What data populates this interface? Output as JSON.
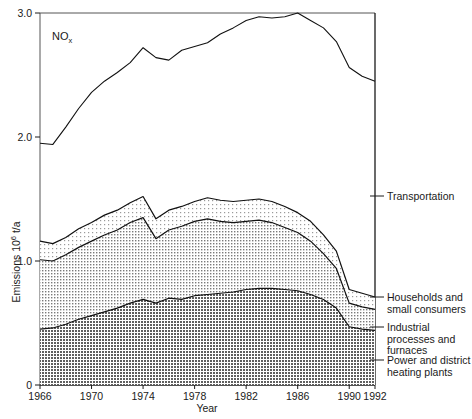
{
  "chart_data": {
    "type": "area",
    "title": "",
    "annotation": "NOx",
    "annotation_base": "NO",
    "annotation_sub": "x",
    "xlabel": "Year",
    "ylabel": "Emissions 10",
    "ylabel_sup": "6",
    "ylabel_tail": " t/a",
    "xlim": [
      1966,
      1992
    ],
    "ylim": [
      0,
      3.0
    ],
    "grid": false,
    "legend_position": "right-outside",
    "xticks": [
      1966,
      1970,
      1974,
      1978,
      1982,
      1986,
      1990,
      1992
    ],
    "xtick_labels": [
      "1966",
      "1970",
      "1974",
      "1978",
      "1982",
      "1986",
      "1990",
      "1992"
    ],
    "yticks": [
      0,
      1.0,
      2.0,
      3.0
    ],
    "ytick_labels": [
      "0",
      "1.0",
      "2.0",
      "3.0"
    ],
    "x": [
      1966,
      1967,
      1968,
      1969,
      1970,
      1971,
      1972,
      1973,
      1974,
      1975,
      1976,
      1977,
      1978,
      1979,
      1980,
      1981,
      1982,
      1983,
      1984,
      1985,
      1986,
      1987,
      1988,
      1989,
      1990,
      1991,
      1992
    ],
    "series": [
      {
        "name": "Power and district heating plants",
        "label": "Power and district\nheating plants",
        "label_lines": [
          "Power and district",
          "heating plants"
        ],
        "fill": "#8c8c8c",
        "values": [
          0.45,
          0.46,
          0.49,
          0.53,
          0.56,
          0.59,
          0.62,
          0.66,
          0.69,
          0.66,
          0.7,
          0.69,
          0.72,
          0.73,
          0.74,
          0.75,
          0.77,
          0.78,
          0.78,
          0.77,
          0.76,
          0.73,
          0.69,
          0.62,
          0.47,
          0.45,
          0.44
        ]
      },
      {
        "name": "Industrial processes and furnaces",
        "label": "Industrial\nprocesses and\nfurnaces",
        "label_lines": [
          "Industrial",
          "processes and",
          "furnaces"
        ],
        "fill": "#d4d4d4",
        "values": [
          0.56,
          0.54,
          0.56,
          0.58,
          0.6,
          0.62,
          0.63,
          0.65,
          0.66,
          0.52,
          0.55,
          0.59,
          0.6,
          0.61,
          0.58,
          0.56,
          0.55,
          0.55,
          0.53,
          0.5,
          0.47,
          0.43,
          0.37,
          0.32,
          0.19,
          0.18,
          0.17
        ]
      },
      {
        "name": "Households and small consumers",
        "label": "Households and\nsmall consumers",
        "label_lines": [
          "Households and",
          "small consumers"
        ],
        "fill": "#e6e6e6",
        "values": [
          0.15,
          0.14,
          0.14,
          0.15,
          0.15,
          0.16,
          0.16,
          0.16,
          0.17,
          0.16,
          0.16,
          0.16,
          0.16,
          0.17,
          0.17,
          0.17,
          0.17,
          0.17,
          0.17,
          0.17,
          0.16,
          0.16,
          0.15,
          0.14,
          0.11,
          0.11,
          0.1
        ]
      },
      {
        "name": "Transportation",
        "label": "Transportation",
        "label_lines": [
          "Transportation"
        ],
        "fill": "none",
        "line_only": true,
        "totals": [
          1.95,
          1.94,
          2.08,
          2.23,
          2.36,
          2.45,
          2.52,
          2.6,
          2.72,
          2.64,
          2.62,
          2.7,
          2.73,
          2.76,
          2.83,
          2.88,
          2.94,
          2.97,
          2.96,
          2.97,
          3.0,
          2.94,
          2.88,
          2.77,
          2.56,
          2.49,
          2.45
        ]
      }
    ]
  }
}
